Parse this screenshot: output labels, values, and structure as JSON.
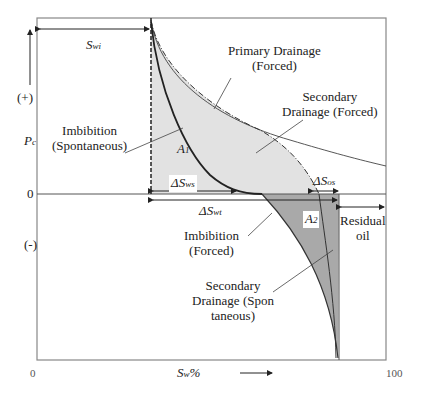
{
  "diagram": {
    "type": "capillary pressure hysteresis",
    "y_axis": {
      "label": "P",
      "label_sub": "c",
      "positive": "(+)",
      "negative": "(-)",
      "zero": "0"
    },
    "x_axis": {
      "label": "S",
      "label_sub": "w",
      "label_suffix": "%",
      "min": "0",
      "max": "100"
    },
    "curves": {
      "primary_drainage": {
        "line1": "Primary Drainage",
        "line2": "(Forced)"
      },
      "secondary_drainage_forced": {
        "line1": "Secondary",
        "line2": "Drainage (Forced)"
      },
      "imbibition_spontaneous": {
        "line1": "Imbibition",
        "line2": "(Spontaneous)"
      },
      "imbibition_forced": {
        "line1": "Imbibition",
        "line2": "(Forced)"
      },
      "secondary_drainage_spontaneous": {
        "line1": "Secondary",
        "line2": "Drainage (Spon",
        "line3": "taneous)"
      }
    },
    "areas": {
      "a1": {
        "label": "A",
        "sub": "1"
      },
      "a2": {
        "label": "A",
        "sub": "2"
      }
    },
    "intervals": {
      "swi": {
        "label": "S",
        "sub": "wi"
      },
      "dsws": {
        "label": "ΔS",
        "sub": "ws"
      },
      "dswt": {
        "label": "ΔS",
        "sub": "wt"
      },
      "dsos": {
        "label": "ΔS",
        "sub": "os"
      },
      "residual_oil": {
        "line1": "Residual",
        "line2": "oil"
      }
    },
    "colors": {
      "area_a1": "#e2e2e2",
      "area_a2": "#a9a9a9",
      "lines": "#333333"
    }
  }
}
